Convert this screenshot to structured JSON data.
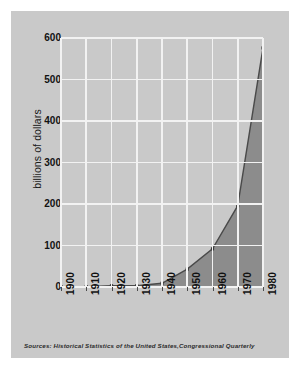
{
  "chart_data": {
    "type": "area",
    "title": "",
    "subtitle": "",
    "xlabel": "",
    "ylabel": "billions of dollars",
    "x": [
      1900,
      1910,
      1920,
      1930,
      1940,
      1950,
      1960,
      1970,
      1980
    ],
    "categories": [
      "1900",
      "1910",
      "1920",
      "1930",
      "1940",
      "1950",
      "1960",
      "1970",
      "1980"
    ],
    "values": [
      1,
      1,
      3,
      3,
      9,
      43,
      92,
      196,
      576
    ],
    "series": [
      {
        "name": "billions of dollars",
        "values": [
          1,
          1,
          3,
          3,
          9,
          43,
          92,
          196,
          576
        ]
      }
    ],
    "ylim": [
      0,
      600
    ],
    "xlim": [
      1900,
      1980
    ],
    "yticks": [
      0,
      100,
      200,
      300,
      400,
      500,
      600
    ],
    "ytick_labels": [
      "0",
      "100",
      "200",
      "300",
      "400",
      "500",
      "600"
    ],
    "xticks": [
      1900,
      1910,
      1920,
      1930,
      1940,
      1950,
      1960,
      1970,
      1980
    ],
    "xtick_labels": [
      "1900",
      "1910",
      "1920",
      "1930",
      "1940",
      "1950",
      "1960",
      "1970",
      "1980"
    ],
    "xtick_rotation": 90,
    "grid": true,
    "grid_color": "#f2f2f2",
    "legend": false,
    "legend_position": "none",
    "fill_color": "#8c8c8c",
    "line_color": "#4a4a4a",
    "marker": "square",
    "marker_color": "#3a3a3a",
    "background_color": "#c9c9c9",
    "page_background": "#ffffff",
    "annotations": []
  },
  "figure": {
    "source_note": "Sources: Historical Statistics of the United States,Congressional Quarterly"
  }
}
